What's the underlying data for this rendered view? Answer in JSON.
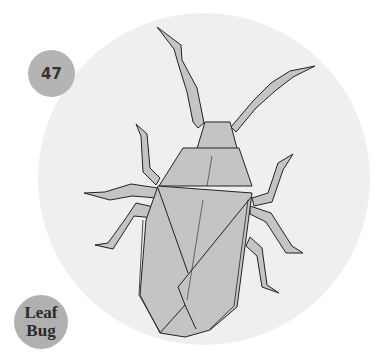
{
  "diagram": {
    "number": "47",
    "title_line1": "Leaf",
    "title_line2": "Bug",
    "colors": {
      "background": "#ffffff",
      "circle": "#efefef",
      "badge": "#b4b4b4",
      "paper": "#c4c4c4",
      "stroke": "#222222"
    }
  }
}
